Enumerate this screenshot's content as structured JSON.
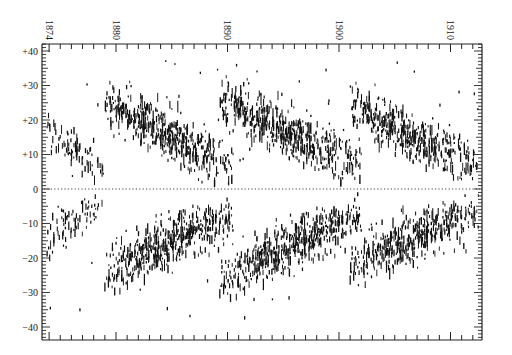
{
  "chart_data": {
    "type": "scatter",
    "title": "",
    "subtitle": "",
    "xlabel": "",
    "ylabel": "",
    "x_axis": {
      "position": "top",
      "ticks": [
        1874,
        1880,
        1890,
        1900,
        1910
      ],
      "tick_labels": [
        "1874",
        "1880",
        "1890",
        "1900",
        "1910"
      ],
      "label_rotation": 90,
      "range": [
        1873.6,
        1913.0
      ],
      "minor_tick_interval_years": 1
    },
    "y_axis": {
      "position": "left",
      "ticks": [
        40,
        30,
        20,
        10,
        0,
        -10,
        -20,
        -30,
        -40
      ],
      "tick_labels": [
        "+40",
        "+30",
        "+20",
        "+10",
        "0",
        "−10",
        "−20",
        "−30",
        "−40"
      ],
      "range": [
        -44,
        42
      ],
      "minor_tick_interval_deg": 1
    },
    "grid": false,
    "legend": null,
    "equator_line": {
      "y": 0,
      "style": "dotted"
    },
    "series": [
      {
        "name": "cycle-ending-1878 (north)",
        "hemisphere": "N",
        "start": 1873.8,
        "end": 1879.0,
        "lat_start": 16,
        "lat_end": 6,
        "spread": 5,
        "density": 0.35
      },
      {
        "name": "cycle-ending-1878 (south)",
        "hemisphere": "S",
        "start": 1873.8,
        "end": 1879.0,
        "lat_start": -14,
        "lat_end": -5,
        "spread": 5,
        "density": 0.35
      },
      {
        "name": "cycle 1879-1890 (north)",
        "hemisphere": "N",
        "start": 1879.0,
        "end": 1890.5,
        "lat_start": 25,
        "lat_end": 6,
        "spread": 6,
        "density": 1.0
      },
      {
        "name": "cycle 1879-1890 (south)",
        "hemisphere": "S",
        "start": 1879.0,
        "end": 1890.5,
        "lat_start": -24,
        "lat_end": -7,
        "spread": 6,
        "density": 1.0
      },
      {
        "name": "cycle 1889-1902 (north)",
        "hemisphere": "N",
        "start": 1889.3,
        "end": 1902.0,
        "lat_start": 26,
        "lat_end": 6,
        "spread": 6,
        "density": 1.0
      },
      {
        "name": "cycle 1889-1902 (south)",
        "hemisphere": "S",
        "start": 1889.3,
        "end": 1902.0,
        "lat_start": -26,
        "lat_end": -7,
        "spread": 6,
        "density": 1.0
      },
      {
        "name": "cycle 1901-1913 (north)",
        "hemisphere": "N",
        "start": 1901.0,
        "end": 1912.5,
        "lat_start": 24,
        "lat_end": 6,
        "spread": 6,
        "density": 0.9
      },
      {
        "name": "cycle 1901-1913 (south)",
        "hemisphere": "S",
        "start": 1901.0,
        "end": 1912.5,
        "lat_start": -22,
        "lat_end": -6,
        "spread": 6,
        "density": 0.9
      }
    ],
    "annotations": []
  },
  "colors": {
    "marks": "#111111",
    "axis": "#222222",
    "background": "#ffffff"
  }
}
